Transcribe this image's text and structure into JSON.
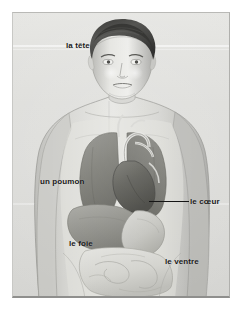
{
  "illustration": {
    "title": "Le corps humain - organes internes",
    "style": "pencil-grayscale-anatomical-drawing",
    "subject": "young man torso with internal organs",
    "background_color": "#dededa",
    "label_color": "#191919",
    "leader_line_color": "#151515"
  },
  "labels": [
    {
      "id": "tete",
      "text": "la tête",
      "organ": "head",
      "has_leader_line": false
    },
    {
      "id": "poumon",
      "text": "un poumon",
      "organ": "lung",
      "has_leader_line": false
    },
    {
      "id": "coeur",
      "text": "le cœur",
      "organ": "heart",
      "has_leader_line": true
    },
    {
      "id": "foie",
      "text": "le foie",
      "organ": "liver",
      "has_leader_line": false
    },
    {
      "id": "ventre",
      "text": "le ventre",
      "organ": "stomach",
      "has_leader_line": false
    }
  ]
}
